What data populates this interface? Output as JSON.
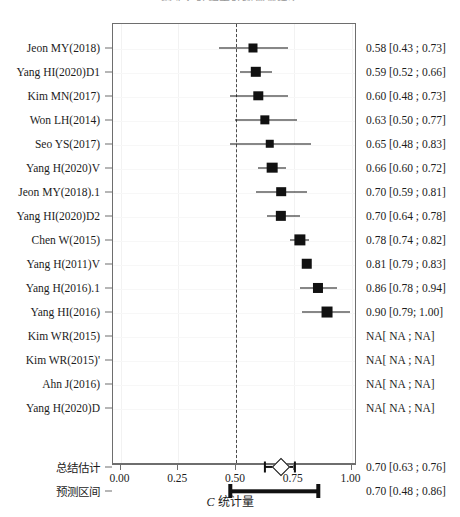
{
  "figure": {
    "title": "图 4  乙肝相关肝癌预测模型",
    "axis_label_prefix": "C",
    "axis_label_suffix": "统计量"
  },
  "chart_data": {
    "type": "forest",
    "title": "图 4  乙肝相关肝癌预测模型",
    "xlabel": "C 统计量",
    "ylabel": "",
    "xlim": [
      0.0,
      1.0
    ],
    "xticks": [
      "0.00",
      "0.25",
      "0.50",
      "0.75",
      "1.00"
    ],
    "xtick_values": [
      0.0,
      0.25,
      0.5,
      0.75,
      1.0
    ],
    "reference_line": 0.5,
    "grid": true,
    "legend": "none",
    "effect_measure": "C-statistic",
    "studies": [
      {
        "label": "Jeon MY(2018)",
        "estimate": 0.58,
        "lower": 0.43,
        "upper": 0.73,
        "text": "0.58 [0.43 ; 0.73]",
        "weight": 0.55
      },
      {
        "label": "Yang HI(2020)D1",
        "estimate": 0.59,
        "lower": 0.52,
        "upper": 0.66,
        "text": "0.59 [0.52 ; 0.66]",
        "weight": 0.8
      },
      {
        "label": "Kim MN(2017)",
        "estimate": 0.6,
        "lower": 0.48,
        "upper": 0.73,
        "text": "0.60 [0.48 ; 0.73]",
        "weight": 0.62
      },
      {
        "label": "Won LH(2014)",
        "estimate": 0.63,
        "lower": 0.5,
        "upper": 0.77,
        "text": "0.63 [0.50 ; 0.77]",
        "weight": 0.6
      },
      {
        "label": "Seo YS(2017)",
        "estimate": 0.65,
        "lower": 0.48,
        "upper": 0.83,
        "text": "0.65 [0.48 ; 0.83]",
        "weight": 0.45
      },
      {
        "label": "Yang H(2020)V",
        "estimate": 0.66,
        "lower": 0.6,
        "upper": 0.72,
        "text": "0.66 [0.60 ; 0.72]",
        "weight": 0.85
      },
      {
        "label": "Jeon MY(2018).1",
        "estimate": 0.7,
        "lower": 0.59,
        "upper": 0.81,
        "text": "0.70 [0.59 ; 0.81]",
        "weight": 0.66
      },
      {
        "label": "Yang HI(2020)D2",
        "estimate": 0.7,
        "lower": 0.64,
        "upper": 0.78,
        "text": "0.70 [0.64 ; 0.78]",
        "weight": 0.78
      },
      {
        "label": "Chen W(2015)",
        "estimate": 0.78,
        "lower": 0.74,
        "upper": 0.82,
        "text": "0.78 [0.74 ; 0.82]",
        "weight": 0.95
      },
      {
        "label": "Yang H(2011)V",
        "estimate": 0.81,
        "lower": 0.79,
        "upper": 0.83,
        "text": "0.81 [0.79 ; 0.83]",
        "weight": 0.82
      },
      {
        "label": "Yang H(2016).1",
        "estimate": 0.86,
        "lower": 0.78,
        "upper": 0.94,
        "text": "0.86 [0.78 ; 0.94]",
        "weight": 0.74
      },
      {
        "label": "Yang HI(2016)",
        "estimate": 0.9,
        "lower": 0.79,
        "upper": 1.0,
        "text": "0.90 [0.79; 1.00]",
        "weight": 0.9
      },
      {
        "label": "Kim WR(2015)",
        "estimate": null,
        "lower": null,
        "upper": null,
        "text": "NA[ NA ; NA]",
        "weight": 0
      },
      {
        "label": "Kim WR(2015)'",
        "estimate": null,
        "lower": null,
        "upper": null,
        "text": "NA[ NA ; NA]",
        "weight": 0
      },
      {
        "label": "Ahn J(2016)",
        "estimate": null,
        "lower": null,
        "upper": null,
        "text": "NA[ NA ; NA]",
        "weight": 0
      },
      {
        "label": "Yang H(2020)D",
        "estimate": null,
        "lower": null,
        "upper": null,
        "text": "NA[ NA ; NA]",
        "weight": 0
      }
    ],
    "summary": {
      "label": "总结估计",
      "estimate": 0.7,
      "lower": 0.63,
      "upper": 0.76,
      "text": "0.70 [0.63 ; 0.76]"
    },
    "prediction": {
      "label": "预测区间",
      "estimate": 0.7,
      "lower": 0.48,
      "upper": 0.86,
      "text": "0.70 [0.48 ; 0.86]"
    }
  }
}
